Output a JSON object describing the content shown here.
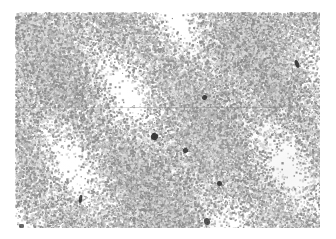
{
  "figure": {
    "kind": "micrograph",
    "caption": "",
    "background_color": "#ffffff"
  },
  "plate": {
    "name": "micrograph-plate",
    "x": 15,
    "y": 12,
    "width": 305,
    "height": 216,
    "grain_color": "#b4b4b4",
    "grain_color_dark": "#8e8e8e",
    "grain_color_light": "#d8d8d8",
    "paper_color": "#ffffff",
    "grain_dot_size_px": 1.6,
    "grain_density": 0.5,
    "mean_gray_level": "#c9c9c9"
  },
  "density_clouds": [
    {
      "x": 40,
      "y": 30,
      "r": 46,
      "opacity": 0.1,
      "color": "#ffffff"
    },
    {
      "x": 120,
      "y": 24,
      "r": 38,
      "opacity": 0.12,
      "color": "#ffffff"
    },
    {
      "x": 205,
      "y": 40,
      "r": 44,
      "opacity": 0.09,
      "color": "#9a9a9a"
    },
    {
      "x": 278,
      "y": 34,
      "r": 40,
      "opacity": 0.11,
      "color": "#ffffff"
    },
    {
      "x": 62,
      "y": 78,
      "r": 42,
      "opacity": 0.1,
      "color": "#9a9a9a"
    },
    {
      "x": 160,
      "y": 72,
      "r": 50,
      "opacity": 0.1,
      "color": "#ffffff"
    },
    {
      "x": 250,
      "y": 92,
      "r": 46,
      "opacity": 0.09,
      "color": "#9a9a9a"
    },
    {
      "x": 35,
      "y": 140,
      "r": 44,
      "opacity": 0.12,
      "color": "#ffffff"
    },
    {
      "x": 118,
      "y": 150,
      "r": 48,
      "opacity": 0.09,
      "color": "#9a9a9a"
    },
    {
      "x": 198,
      "y": 138,
      "r": 40,
      "opacity": 0.11,
      "color": "#ffffff"
    },
    {
      "x": 272,
      "y": 160,
      "r": 46,
      "opacity": 0.1,
      "color": "#9a9a9a"
    },
    {
      "x": 80,
      "y": 196,
      "r": 42,
      "opacity": 0.1,
      "color": "#ffffff"
    },
    {
      "x": 175,
      "y": 200,
      "r": 44,
      "opacity": 0.09,
      "color": "#9a9a9a"
    },
    {
      "x": 262,
      "y": 204,
      "r": 40,
      "opacity": 0.11,
      "color": "#ffffff"
    }
  ],
  "dark_specks": [
    {
      "id": "speck-1",
      "x": 295,
      "y": 60,
      "w": 4,
      "h": 8,
      "rot": -22,
      "radius": "45%",
      "opacity": 0.88
    },
    {
      "id": "speck-2",
      "x": 202,
      "y": 95,
      "w": 5,
      "h": 5,
      "rot": 12,
      "radius": "50%",
      "opacity": 0.85
    },
    {
      "id": "speck-3",
      "x": 151,
      "y": 133,
      "w": 7,
      "h": 7,
      "rot": 30,
      "radius": "45%",
      "opacity": 0.9
    },
    {
      "id": "speck-4",
      "x": 183,
      "y": 148,
      "w": 5,
      "h": 5,
      "rot": -15,
      "radius": "40%",
      "opacity": 0.82
    },
    {
      "id": "speck-5",
      "x": 217,
      "y": 181,
      "w": 5,
      "h": 5,
      "rot": 0,
      "radius": "50%",
      "opacity": 0.86
    },
    {
      "id": "speck-6",
      "x": 79,
      "y": 195,
      "w": 3,
      "h": 8,
      "rot": 8,
      "radius": "35%",
      "opacity": 0.84
    },
    {
      "id": "speck-7",
      "x": 204,
      "y": 218,
      "w": 6,
      "h": 7,
      "rot": -10,
      "radius": "45%",
      "opacity": 0.8
    },
    {
      "id": "speck-8",
      "x": 19,
      "y": 224,
      "w": 5,
      "h": 4,
      "rot": 0,
      "radius": "30%",
      "opacity": 0.7
    }
  ],
  "scratch_lines": [
    {
      "id": "scratch-1",
      "x": 15,
      "y": 107,
      "width": 120,
      "height": 1,
      "opacity": 0.3,
      "color": "#8a8a8a"
    },
    {
      "id": "scratch-2",
      "x": 130,
      "y": 107,
      "width": 150,
      "height": 1,
      "opacity": 0.38,
      "color": "#7d7d7d"
    }
  ]
}
